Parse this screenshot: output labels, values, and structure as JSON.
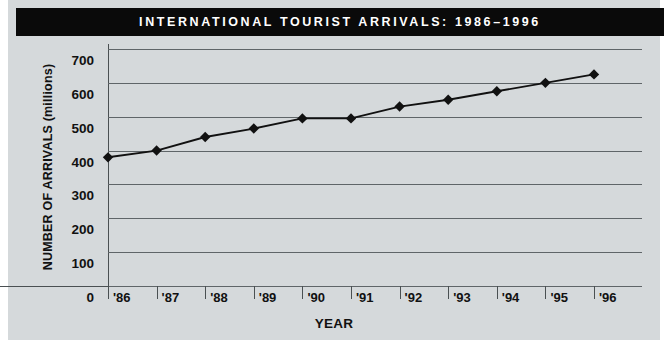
{
  "banner": {
    "title": "INTERNATIONAL TOURIST ARRIVALS: 1986–1996"
  },
  "axes": {
    "ylabel": "NUMBER OF ARRIVALS (millions)",
    "xlabel": "YEAR"
  },
  "colors": {
    "banner_background": "#0a0a0a",
    "banner_text": "#ffffff",
    "panel_background": "#d5d9db",
    "gridline": "#5f6568",
    "axis": "#4a5052",
    "series_line": "#111111",
    "marker": "#111111"
  },
  "chart_data": {
    "type": "line",
    "title": "INTERNATIONAL TOURIST ARRIVALS: 1986–1996",
    "xlabel": "YEAR",
    "ylabel": "NUMBER OF ARRIVALS (millions)",
    "categories": [
      "'86",
      "'87",
      "'88",
      "'89",
      "'90",
      "'91",
      "'92",
      "'93",
      "'94",
      "'95",
      "'96"
    ],
    "values": [
      380,
      400,
      440,
      465,
      495,
      495,
      530,
      550,
      575,
      600,
      625
    ],
    "ylim": [
      0,
      700
    ],
    "yticks": [
      0,
      100,
      200,
      300,
      400,
      500,
      600,
      700
    ],
    "ytick_labels": [
      "0",
      "100",
      "200",
      "300",
      "400",
      "500",
      "600",
      "700"
    ],
    "grid": true,
    "legend": false,
    "marker": "diamond"
  }
}
